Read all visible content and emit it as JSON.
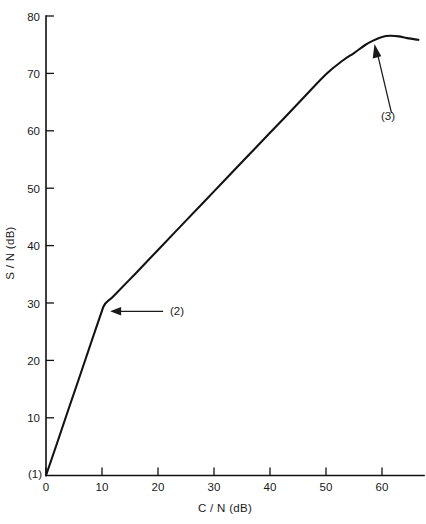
{
  "chart_data": {
    "type": "line",
    "title": "",
    "xlabel": "C / N (dB)",
    "ylabel": "S / N (dB)",
    "xlim": [
      0,
      69
    ],
    "ylim": [
      0,
      80
    ],
    "xticks": [
      0,
      10,
      20,
      30,
      40,
      50,
      60
    ],
    "xtick_labels": [
      "0",
      "10",
      "20",
      "30",
      "40",
      "50",
      "60"
    ],
    "yticks": [
      10,
      20,
      30,
      40,
      50,
      60,
      70,
      80
    ],
    "ytick_labels": [
      "10",
      "20",
      "30",
      "40",
      "50",
      "60",
      "70",
      "80"
    ],
    "grid": false,
    "legend": "none",
    "series": [
      {
        "name": "S/N vs C/N",
        "x": [
          0.0,
          2.0,
          4.0,
          6.0,
          8.0,
          10.2,
          12.0,
          16.0,
          20.0,
          25.0,
          30.0,
          35.0,
          40.0,
          45.0,
          50.0,
          53.0,
          55.0,
          57.0,
          58.5,
          60.0,
          61.5,
          63.0,
          64.5,
          66.5
        ],
        "y": [
          0.0,
          5.7,
          11.5,
          17.2,
          23.0,
          29.3,
          31.2,
          35.2,
          39.3,
          44.4,
          49.5,
          54.6,
          59.7,
          64.8,
          69.9,
          72.3,
          73.6,
          75.0,
          75.8,
          76.4,
          76.6,
          76.5,
          76.2,
          75.9
        ]
      }
    ],
    "annotations": [
      {
        "id": "callout-1",
        "label": "(1)",
        "point_x": 0.0,
        "point_y": 0.0,
        "note": "origin / threshold start"
      },
      {
        "id": "callout-2",
        "label": "(2)",
        "point_x": 10.2,
        "point_y": 29.3,
        "note": "FM threshold knee"
      },
      {
        "id": "callout-3",
        "label": "(3)",
        "point_x": 58.3,
        "point_y": 75.7,
        "note": "saturation / peak"
      }
    ],
    "colors": {
      "curve": "#121212",
      "axis": "#111111",
      "text": "#1a1a1a",
      "background": "#ffffff"
    }
  }
}
